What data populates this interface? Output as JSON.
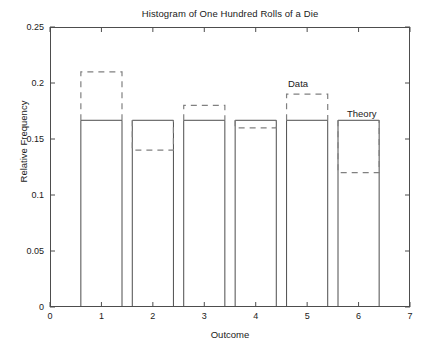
{
  "chart_data": {
    "type": "bar",
    "title": "Histogram of One Hundred Rolls of a Die",
    "xlabel": "Outcome",
    "ylabel": "Relative Frequency",
    "categories": [
      "1",
      "2",
      "3",
      "4",
      "5",
      "6"
    ],
    "xlim": [
      0,
      7
    ],
    "ylim": [
      0,
      0.25
    ],
    "xticks": [
      "0",
      "1",
      "2",
      "3",
      "4",
      "5",
      "6",
      "7"
    ],
    "xtick_values": [
      0,
      1,
      2,
      3,
      4,
      5,
      6,
      7
    ],
    "yticks": [
      "0",
      "0.05",
      "0.1",
      "0.15",
      "0.2",
      "0.25"
    ],
    "ytick_values": [
      0,
      0.05,
      0.1,
      0.15,
      0.2,
      0.25
    ],
    "grid": false,
    "legend_position": "inline-annotations",
    "bar_width": 0.8,
    "series": [
      {
        "name": "Theory",
        "style": "solid",
        "color": "#4d4d4d",
        "values": [
          0.1667,
          0.1667,
          0.1667,
          0.1667,
          0.1667,
          0.1667
        ]
      },
      {
        "name": "Data",
        "style": "dashed",
        "color": "#808080",
        "values": [
          0.21,
          0.14,
          0.18,
          0.16,
          0.19,
          0.12
        ]
      }
    ],
    "annotations": [
      {
        "text": "Data",
        "x": 4.6,
        "y": 0.197
      },
      {
        "text": "Theory",
        "x": 5.72,
        "y": 0.1745
      }
    ]
  }
}
